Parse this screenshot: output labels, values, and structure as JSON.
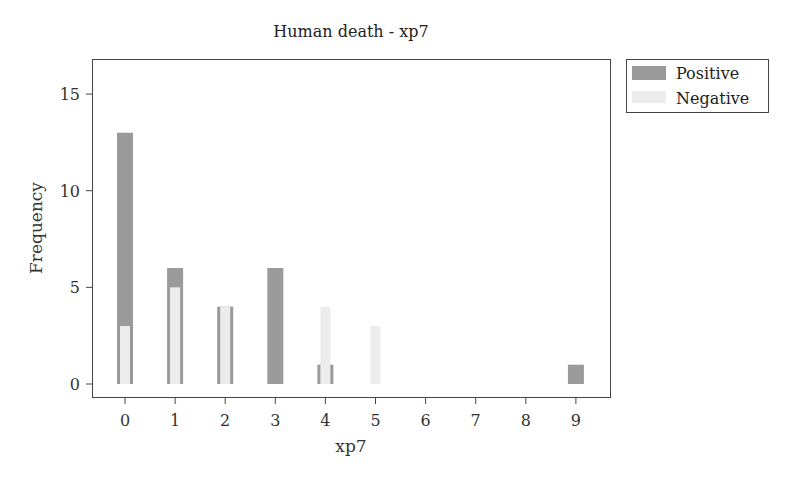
{
  "chart_data": {
    "type": "bar",
    "title": "Human death - xp7",
    "xlabel": "xp7",
    "ylabel": "Frequency",
    "categories": [
      "0",
      "1",
      "2",
      "3",
      "4",
      "5",
      "6",
      "7",
      "8",
      "9"
    ],
    "series": [
      {
        "name": "Positive",
        "color": "#9a9a9a",
        "values": [
          13,
          6,
          4,
          6,
          1,
          0,
          0,
          0,
          0,
          1
        ]
      },
      {
        "name": "Negative",
        "color": "#ececec",
        "values": [
          3,
          5,
          4,
          0,
          4,
          3,
          0,
          0,
          0,
          0
        ]
      }
    ],
    "xlim": [
      -0.65,
      9.7
    ],
    "ylim": [
      -0.7,
      16.8
    ],
    "yticks": [
      0,
      5,
      10,
      15
    ],
    "xticks": [
      0,
      1,
      2,
      3,
      4,
      5,
      6,
      7,
      8,
      9
    ],
    "grid": false,
    "legend_position": "outside-right-top",
    "overlay": "negative bars drawn inside positive bars"
  },
  "legend": {
    "items": [
      {
        "label": "Positive",
        "color": "#9a9a9a"
      },
      {
        "label": "Negative",
        "color": "#ececec"
      }
    ]
  }
}
